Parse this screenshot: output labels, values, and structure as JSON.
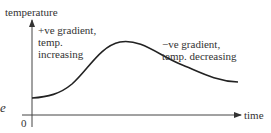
{
  "diagram": {
    "axes": {
      "y_label": "temperature",
      "x_label": "time",
      "origin_label": "0"
    },
    "annotations": [
      {
        "lines": [
          "+ve gradient,",
          "temp.",
          "increasing"
        ]
      },
      {
        "lines": [
          "−ve gradient,",
          "temp. decreasing"
        ]
      }
    ],
    "cropped_fragment": "e",
    "curve": {
      "description": "temperature rises from a starting value to a peak then decreases and levels off",
      "points_px": [
        [
          32,
          98
        ],
        [
          60,
          92
        ],
        [
          85,
          68
        ],
        [
          125,
          42
        ],
        [
          170,
          60
        ],
        [
          205,
          75
        ],
        [
          238,
          82
        ]
      ]
    },
    "colors": {
      "line": "#222222",
      "axis": "#444444",
      "text": "#333333"
    }
  }
}
